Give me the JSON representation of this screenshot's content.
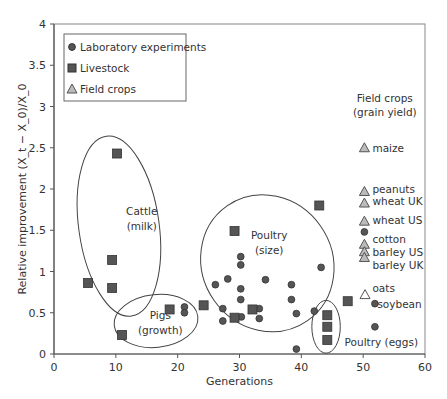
{
  "chart_data": {
    "type": "scatter",
    "title": "",
    "xlabel": "Generations",
    "ylabel": "Relative improvement (X_t − X_0)/X_0",
    "xlim": [
      0,
      60
    ],
    "ylim": [
      0,
      4
    ],
    "xticks": [
      0,
      10,
      20,
      30,
      40,
      50,
      60
    ],
    "yticks": [
      0,
      0.5,
      1,
      1.5,
      2,
      2.5,
      3,
      3.5,
      4
    ],
    "grid": false,
    "legend": {
      "position": "upper-left",
      "entries": [
        {
          "label": "Laboratory experiments",
          "marker": "circle"
        },
        {
          "label": "Livestock",
          "marker": "square"
        },
        {
          "label": "Field crops",
          "marker": "triangle"
        }
      ]
    },
    "series": [
      {
        "name": "Laboratory experiments",
        "marker": "circle",
        "points": [
          [
            21.1,
            0.57
          ],
          [
            21.1,
            0.5
          ],
          [
            30.2,
            1.18
          ],
          [
            30.2,
            1.08
          ],
          [
            34.2,
            0.9
          ],
          [
            28.1,
            0.91
          ],
          [
            26.1,
            0.84
          ],
          [
            30.2,
            0.79
          ],
          [
            38.4,
            0.84
          ],
          [
            43.2,
            1.05
          ],
          [
            30.2,
            0.66
          ],
          [
            38.4,
            0.66
          ],
          [
            27.3,
            0.55
          ],
          [
            27.3,
            0.4
          ],
          [
            33.2,
            0.55
          ],
          [
            33.2,
            0.43
          ],
          [
            30.3,
            0.45
          ],
          [
            39.2,
            0.49
          ],
          [
            42.1,
            0.52
          ],
          [
            39.2,
            0.06
          ],
          [
            50.2,
            1.48
          ],
          [
            51.9,
            0.61
          ],
          [
            51.9,
            0.33
          ]
        ]
      },
      {
        "name": "Livestock",
        "marker": "square",
        "points": [
          [
            10.2,
            2.43
          ],
          [
            9.4,
            1.14
          ],
          [
            5.5,
            0.86
          ],
          [
            9.4,
            0.8
          ],
          [
            11.0,
            0.23
          ],
          [
            18.7,
            0.54
          ],
          [
            24.2,
            0.59
          ],
          [
            29.2,
            1.49
          ],
          [
            29.2,
            0.44
          ],
          [
            32.1,
            0.54
          ],
          [
            42.9,
            1.8
          ],
          [
            47.5,
            0.64
          ],
          [
            44.2,
            0.47
          ],
          [
            44.2,
            0.33
          ],
          [
            44.2,
            0.17
          ]
        ]
      },
      {
        "name": "Field crops",
        "marker": "triangle",
        "points": [
          [
            50.2,
            2.5
          ],
          [
            50.2,
            1.97
          ],
          [
            50.2,
            1.83
          ],
          [
            50.2,
            1.61
          ],
          [
            50.2,
            1.33
          ],
          [
            50.2,
            1.24
          ],
          [
            50.2,
            1.17
          ],
          [
            50.3,
            0.72
          ]
        ]
      }
    ],
    "groups": [
      {
        "label": "Cattle (milk)",
        "cx": 10.5,
        "cy": 1.55,
        "rx": 6.5,
        "ry": 1.1,
        "rotate": -8
      },
      {
        "label": "Pigs (growth)",
        "cx": 16.5,
        "cy": 0.4,
        "rx": 6.8,
        "ry": 0.32,
        "rotate": -6
      },
      {
        "label": "Poultry (size)",
        "cx": 34.5,
        "cy": 1.1,
        "rx": 10.5,
        "ry": 0.85,
        "rotate": -35
      },
      {
        "label": "Poultry (eggs)",
        "cx": 44.0,
        "cy": 0.33,
        "rx": 2.3,
        "ry": 0.32,
        "rotate": 0
      }
    ],
    "annotations": [
      {
        "text": "Field crops",
        "x": 53.5,
        "y": 3.1
      },
      {
        "text": "(grain yield)",
        "x": 53.5,
        "y": 2.93
      },
      {
        "text": "maize",
        "x": 51.5,
        "y": 2.5
      },
      {
        "text": "peanuts",
        "x": 51.5,
        "y": 2.0
      },
      {
        "text": "wheat UK",
        "x": 51.5,
        "y": 1.85
      },
      {
        "text": "wheat US",
        "x": 51.5,
        "y": 1.62
      },
      {
        "text": "cotton",
        "x": 51.5,
        "y": 1.4
      },
      {
        "text": "barley US",
        "x": 51.5,
        "y": 1.24
      },
      {
        "text": "barley UK",
        "x": 51.5,
        "y": 1.08
      },
      {
        "text": "oats",
        "x": 51.5,
        "y": 0.8
      },
      {
        "text": "soybean",
        "x": 52.3,
        "y": 0.61
      },
      {
        "text": "Poultry (eggs)",
        "x": 47.0,
        "y": 0.15
      }
    ]
  },
  "colors": {
    "marker_fill": "#555555",
    "marker_stroke": "#333333",
    "triangle_fill": "#bbbbbb",
    "axis": "#555555",
    "text": "#333333"
  }
}
